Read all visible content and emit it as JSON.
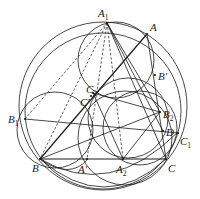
{
  "figure": {
    "title": "",
    "points": [
      {
        "id": "A1",
        "label": "A",
        "sub": "1",
        "prime": ""
      },
      {
        "id": "A",
        "label": "A",
        "sub": "",
        "prime": ""
      },
      {
        "id": "B_prime",
        "label": "B",
        "sub": "",
        "prime": "′"
      },
      {
        "id": "C2",
        "label": "C",
        "sub": "2",
        "prime": ""
      },
      {
        "id": "C_prime",
        "label": "C",
        "sub": "",
        "prime": "′"
      },
      {
        "id": "B1",
        "label": "B",
        "sub": "1",
        "prime": ""
      },
      {
        "id": "B2",
        "label": "B",
        "sub": "2",
        "prime": ""
      },
      {
        "id": "D",
        "label": "D",
        "sub": "",
        "prime": ""
      },
      {
        "id": "C1",
        "label": "C",
        "sub": "1",
        "prime": ""
      },
      {
        "id": "B",
        "label": "B",
        "sub": "",
        "prime": ""
      },
      {
        "id": "A_prime",
        "label": "A",
        "sub": "",
        "prime": "′"
      },
      {
        "id": "A2",
        "label": "A",
        "sub": "2",
        "prime": ""
      },
      {
        "id": "C",
        "label": "C",
        "sub": "",
        "prime": ""
      }
    ],
    "segments": [
      [
        "A",
        "B"
      ],
      [
        "B",
        "C"
      ],
      [
        "A",
        "C"
      ],
      [
        "B1",
        "C1"
      ],
      [
        "A1",
        "C"
      ],
      [
        "A1",
        "B2"
      ],
      [
        "B2",
        "A2"
      ],
      [
        "A2",
        "C2"
      ],
      [
        "B",
        "B2"
      ],
      [
        "A1",
        "D"
      ],
      [
        "C2",
        "B2"
      ]
    ],
    "dashed_segments": [
      [
        "A1",
        "B"
      ],
      [
        "A1",
        "A_prime"
      ],
      [
        "A1",
        "A2"
      ],
      [
        "B1",
        "A1"
      ]
    ]
  }
}
